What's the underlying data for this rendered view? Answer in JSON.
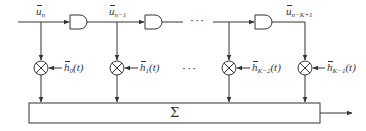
{
  "diagram": {
    "type": "tapped-delay-line / transversal filter block diagram",
    "colors": {
      "stroke": "#333333",
      "background": "#ffffff"
    },
    "input_taps": [
      {
        "symbol": "u",
        "subscript": "n",
        "full": "ũ_n"
      },
      {
        "symbol": "u",
        "subscript": "n−1",
        "full": "ũ_{n−1}"
      },
      {
        "symbol": "u",
        "subscript": "n−K+1",
        "full": "ũ_{n−K+1}"
      }
    ],
    "weights": [
      {
        "symbol": "h",
        "subscript": "0",
        "arg": "(t)",
        "full": "h̃_0(t)"
      },
      {
        "symbol": "h",
        "subscript": "1",
        "arg": "(t)",
        "full": "h̃_1(t)"
      },
      {
        "symbol": "h",
        "subscript": "K−2",
        "arg": "(t)",
        "full": "h̃_{K−2}(t)"
      },
      {
        "symbol": "h",
        "subscript": "K−1",
        "arg": "(t)",
        "full": "h̃_{K−1}(t)"
      }
    ],
    "ellipsis_top": "···",
    "ellipsis_mid": "···",
    "summer_label": "Σ",
    "delay_elements": 3,
    "multipliers": 4
  }
}
